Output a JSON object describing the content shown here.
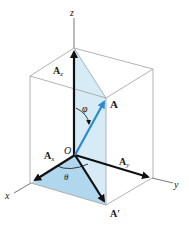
{
  "diagram": {
    "colors": {
      "box_line": "#9a9a9a",
      "shade": "#bfe0f0",
      "vector_black": "#111111",
      "vector_blue": "#2a8ccc",
      "axis": "#555555"
    },
    "axes": {
      "x": "x",
      "y": "y",
      "z": "z"
    },
    "origin_label": "O",
    "vectors": {
      "A": "A",
      "Ax_main": "A",
      "Ax_sub": "x",
      "Ay_main": "A",
      "Ay_sub": "y",
      "Az_main": "A",
      "Az_sub": "z",
      "A_prime": "A′"
    },
    "angles": {
      "phi": "φ",
      "theta": "θ"
    }
  }
}
